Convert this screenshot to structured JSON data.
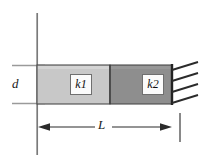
{
  "figure": {
    "type": "engineering-diagram",
    "background_color": "#ffffff",
    "labels": {
      "depth": "d",
      "length": "L",
      "segment_1_base": "k",
      "segment_1_sub": "1",
      "segment_2_base": "k",
      "segment_2_sub": "2"
    },
    "segments": [
      {
        "name": "segment-k1",
        "label_base": "k",
        "label_sub": "1",
        "fill": "#c8c8c8",
        "stroke": "#4a4a4a",
        "x": 37,
        "y": 65,
        "width": 73,
        "height": 39
      },
      {
        "name": "segment-k2",
        "label_base": "k",
        "label_sub": "2",
        "fill": "#8e8e8e",
        "stroke": "#4a4a4a",
        "x": 110,
        "y": 65,
        "width": 62,
        "height": 39
      }
    ],
    "wall": {
      "name": "left-reference-line",
      "x": 37,
      "y_top": 13,
      "y_bottom": 155,
      "color": "#7a7a7a",
      "width": 1.6
    },
    "fixed_support": {
      "name": "hatched-fixed-support",
      "edge_x": 172,
      "hatch_count": 4,
      "color": "#2e2e2e"
    },
    "depth_dimension": {
      "name": "depth-dimension-d",
      "extension_top_y": 65,
      "extension_bottom_y": 104,
      "x_start": 12,
      "x_end": 45,
      "color": "#9a9a9a"
    },
    "length_dimension": {
      "name": "length-dimension-L",
      "y": 127,
      "x_start": 37,
      "x_end": 172,
      "color": "#2e2e2e",
      "tick_x": 180,
      "tick_top": 113,
      "tick_bottom": 142
    },
    "colors": {
      "light_gray": "#c8c8c8",
      "dark_gray": "#8e8e8e",
      "outline": "#4a4a4a",
      "ink": "#2e2e2e",
      "faint": "#9a9a9a"
    }
  }
}
